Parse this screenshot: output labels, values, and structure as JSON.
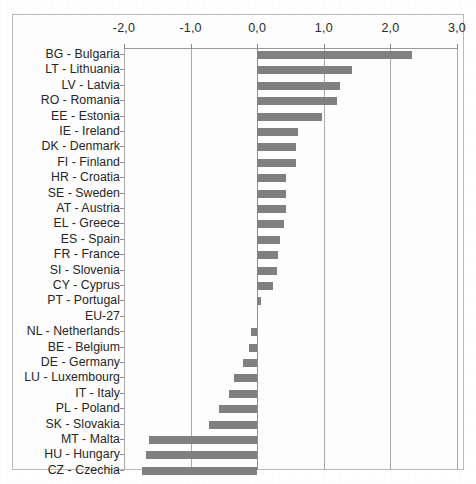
{
  "chart_data": {
    "type": "bar",
    "orientation": "horizontal",
    "title": "",
    "subtitle": "",
    "xlabel": "",
    "ylabel": "",
    "xlim": [
      -2.0,
      3.0
    ],
    "grid": true,
    "legend": null,
    "decimal_separator": ",",
    "xtick_labels": [
      "-2,0",
      "-1,0",
      "0,0",
      "1,0",
      "2,0",
      "3,0"
    ],
    "xticks": [
      -2.0,
      -1.0,
      0.0,
      1.0,
      2.0,
      3.0
    ],
    "bar_color": "#808080",
    "categories": [
      "BG - Bulgaria",
      "LT - Lithuania",
      "LV - Latvia",
      "RO - Romania",
      "EE - Estonia",
      "IE - Ireland",
      "DK - Denmark",
      "FI - Finland",
      "HR - Croatia",
      "SE - Sweden",
      "AT - Austria",
      "EL - Greece",
      "ES - Spain",
      "FR - France",
      "SI - Slovenia",
      "CY - Cyprus",
      "PT - Portugal",
      "EU-27",
      "NL - Netherlands",
      "BE - Belgium",
      "DE - Germany",
      "LU - Luxembourg",
      "IT - Italy",
      "PL - Poland",
      "SK - Slovakia",
      "MT - Malta",
      "HU - Hungary",
      "CZ - Czechia"
    ],
    "values": [
      2.32,
      1.42,
      1.25,
      1.2,
      0.98,
      0.62,
      0.58,
      0.58,
      0.44,
      0.43,
      0.43,
      0.4,
      0.35,
      0.32,
      0.3,
      0.23,
      0.05,
      0.0,
      -0.1,
      -0.12,
      -0.22,
      -0.35,
      -0.42,
      -0.58,
      -0.72,
      -1.62,
      -1.67,
      -1.73
    ]
  }
}
